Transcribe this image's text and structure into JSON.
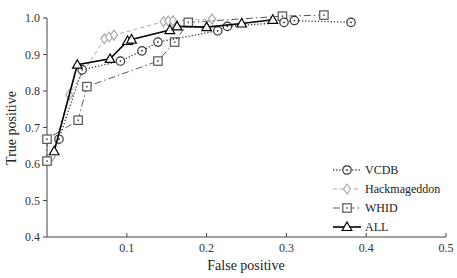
{
  "chart_data": {
    "type": "line",
    "title": "",
    "xlabel": "False positive",
    "ylabel": "True positive",
    "xlim": [
      0,
      0.5
    ],
    "ylim": [
      0.4,
      1.0
    ],
    "xticks": [
      "0.1",
      "0.2",
      "0.3",
      "0.4",
      "0.5"
    ],
    "yticks": [
      "0.4",
      "0.5",
      "0.6",
      "0.7",
      "0.8",
      "0.9",
      "1.0"
    ],
    "grid": false,
    "legend_position": "lower right",
    "series": [
      {
        "name": "VCDB",
        "marker": "circle",
        "line": "dotted",
        "color": "#333333",
        "points": [
          [
            0.015,
            0.668
          ],
          [
            0.044,
            0.858
          ],
          [
            0.092,
            0.882
          ],
          [
            0.119,
            0.91
          ],
          [
            0.139,
            0.934
          ],
          [
            0.214,
            0.965
          ],
          [
            0.226,
            0.977
          ],
          [
            0.297,
            0.988
          ],
          [
            0.31,
            0.993
          ],
          [
            0.381,
            0.988
          ]
        ]
      },
      {
        "name": "Hackmageddon",
        "marker": "diamond",
        "line": "dashed",
        "color": "#aaaaaa",
        "points": [
          [
            0.006,
            0.62
          ],
          [
            0.028,
            0.79
          ],
          [
            0.072,
            0.943
          ],
          [
            0.078,
            0.948
          ],
          [
            0.084,
            0.953
          ],
          [
            0.146,
            0.99
          ],
          [
            0.152,
            0.992
          ],
          [
            0.158,
            0.992
          ],
          [
            0.207,
            0.997
          ]
        ]
      },
      {
        "name": "WHID",
        "marker": "square",
        "line": "dashdot",
        "color": "#555555",
        "points": [
          [
            0.0,
            0.608
          ],
          [
            0.0,
            0.668
          ],
          [
            0.039,
            0.72
          ],
          [
            0.05,
            0.812
          ],
          [
            0.139,
            0.882
          ],
          [
            0.16,
            0.934
          ],
          [
            0.177,
            0.988
          ],
          [
            0.295,
            1.005
          ],
          [
            0.347,
            1.008
          ]
        ]
      },
      {
        "name": "ALL",
        "marker": "triangle",
        "line": "solid",
        "color": "#000000",
        "points": [
          [
            0.009,
            0.635
          ],
          [
            0.038,
            0.872
          ],
          [
            0.079,
            0.888
          ],
          [
            0.101,
            0.937
          ],
          [
            0.106,
            0.941
          ],
          [
            0.154,
            0.967
          ],
          [
            0.163,
            0.977
          ],
          [
            0.2,
            0.975
          ],
          [
            0.244,
            0.985
          ],
          [
            0.283,
            0.995
          ]
        ]
      }
    ]
  }
}
